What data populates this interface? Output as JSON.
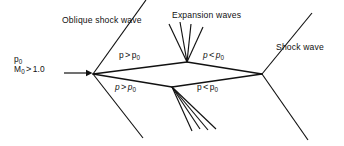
{
  "figure": {
    "domain": "Diagram",
    "title_visible": false,
    "background_color": "#ffffff",
    "line_color": "#111111",
    "width": 344,
    "height": 146
  },
  "labels": {
    "oblique_shock_wave": "Oblique shock wave",
    "expansion_waves": "Expansion waves",
    "shock_wave": "Shock wave",
    "freestream_pressure": "p",
    "freestream_pressure_sub": "0",
    "freestream_mach": "M",
    "freestream_mach_sub": "0",
    "freestream_mach_relation": ">",
    "freestream_mach_value": "1.0"
  },
  "pressure_regions": [
    {
      "id": "upper-left",
      "p": "p",
      "relation": ">",
      "reference": "p",
      "reference_sub": "0",
      "text": "p > p0",
      "italic": false
    },
    {
      "id": "upper-right",
      "p": "p",
      "relation": "<",
      "reference": "p",
      "reference_sub": "0",
      "text": "p < p0",
      "italic": true
    },
    {
      "id": "lower-left",
      "p": "p",
      "relation": ">",
      "reference": "p",
      "reference_sub": "0",
      "text": "p > p0",
      "italic": true
    },
    {
      "id": "lower-right",
      "p": "p",
      "relation": "<",
      "reference": "p",
      "reference_sub": "0",
      "text": "p < p0",
      "italic": false
    }
  ],
  "geometry": {
    "nose": {
      "x": 93,
      "y": 74
    },
    "tail": {
      "x": 262,
      "y": 74
    },
    "upper_shoulder": {
      "x": 187,
      "y": 62
    },
    "lower_shoulder": {
      "x": 172,
      "y": 87
    },
    "airfoil_outline": [
      {
        "from": "nose",
        "to": "upper_shoulder"
      },
      {
        "from": "upper_shoulder",
        "to": "tail"
      },
      {
        "from": "nose",
        "to": "lower_shoulder"
      },
      {
        "from": "lower_shoulder",
        "to": "tail"
      }
    ],
    "nose_shocks": [
      {
        "name": "upper-oblique-shock",
        "x1": 93,
        "y1": 74,
        "x2": 146,
        "y2": 0
      },
      {
        "name": "lower-oblique-shock",
        "x1": 93,
        "y1": 74,
        "x2": 143,
        "y2": 138
      }
    ],
    "tail_shocks": [
      {
        "name": "upper-tail-shock",
        "x1": 262,
        "y1": 74,
        "x2": 312,
        "y2": 13
      },
      {
        "name": "lower-tail-shock",
        "x1": 262,
        "y1": 74,
        "x2": 308,
        "y2": 140
      }
    ],
    "upper_expansion_fan": [
      {
        "x1": 187,
        "y1": 62,
        "x2": 169,
        "y2": 24
      },
      {
        "x1": 187,
        "y1": 62,
        "x2": 180,
        "y2": 22
      },
      {
        "x1": 187,
        "y1": 62,
        "x2": 191,
        "y2": 24
      },
      {
        "x1": 187,
        "y1": 62,
        "x2": 203,
        "y2": 27
      }
    ],
    "lower_expansion_fan": [
      {
        "x1": 172,
        "y1": 87,
        "x2": 192,
        "y2": 131
      },
      {
        "x1": 172,
        "y1": 87,
        "x2": 200,
        "y2": 129
      },
      {
        "x1": 172,
        "y1": 87,
        "x2": 208,
        "y2": 130
      },
      {
        "x1": 172,
        "y1": 87,
        "x2": 216,
        "y2": 129
      }
    ],
    "flow_arrow": {
      "x1": 64,
      "y1": 73,
      "x2": 90,
      "y2": 73
    }
  },
  "icons": {
    "flow_direction": "right-arrow-icon"
  }
}
